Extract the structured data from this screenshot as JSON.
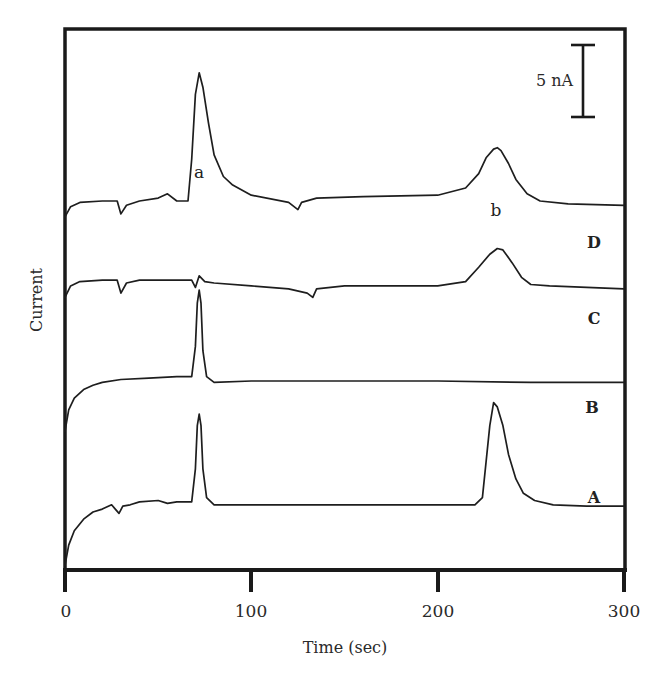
{
  "chart_data": {
    "type": "line",
    "title": "",
    "xlabel": "Time (sec)",
    "ylabel": "Current",
    "xlim": [
      0,
      300
    ],
    "xticks": [
      0,
      100,
      200,
      300
    ],
    "xtick_labels": [
      "0",
      "100",
      "200",
      "300"
    ],
    "grid": false,
    "legend": "none (traces labeled inline at right)",
    "scale_bar": {
      "label": "5 nA",
      "value_nA": 5
    },
    "peak_labels": [
      {
        "label": "a",
        "time_sec": 72
      },
      {
        "label": "b",
        "time_sec": 232
      }
    ],
    "series_note": "Stacked amperometric traces, vertically offset; y values are relative current in nA (arbitrary offset).",
    "series": [
      {
        "name": "D",
        "offset_nA": 21,
        "x": [
          0,
          3,
          8,
          20,
          28,
          30,
          33,
          40,
          50,
          55,
          60,
          66,
          68,
          70,
          72,
          74,
          77,
          80,
          85,
          90,
          100,
          120,
          125,
          127,
          135,
          160,
          200,
          215,
          222,
          226,
          230,
          232,
          234,
          238,
          242,
          248,
          255,
          270,
          300
        ],
        "y": [
          -0.5,
          0.2,
          0.5,
          0.6,
          0.6,
          -0.3,
          0.3,
          0.6,
          0.8,
          1.1,
          0.6,
          0.6,
          3.5,
          8.0,
          9.5,
          8.5,
          6.0,
          3.8,
          2.3,
          1.7,
          1.0,
          0.5,
          0.0,
          0.5,
          0.8,
          0.9,
          1.0,
          1.5,
          2.5,
          3.6,
          4.2,
          4.3,
          4.1,
          3.2,
          2.1,
          1.1,
          0.6,
          0.4,
          0.3
        ]
      },
      {
        "name": "C",
        "offset_nA": 15.5,
        "x": [
          0,
          3,
          8,
          20,
          28,
          30,
          33,
          40,
          60,
          68,
          70,
          72,
          75,
          80,
          100,
          120,
          130,
          133,
          135,
          150,
          200,
          215,
          222,
          228,
          232,
          235,
          240,
          245,
          250,
          260,
          300
        ],
        "y": [
          -0.6,
          0.2,
          0.5,
          0.6,
          0.6,
          -0.3,
          0.4,
          0.6,
          0.6,
          0.6,
          0.1,
          0.9,
          0.5,
          0.4,
          0.2,
          0.0,
          -0.3,
          -0.6,
          0.0,
          0.2,
          0.2,
          0.5,
          1.5,
          2.4,
          2.8,
          2.7,
          1.8,
          0.8,
          0.3,
          0.2,
          0.0
        ]
      },
      {
        "name": "B",
        "offset_nA": 8,
        "x": [
          0,
          2,
          5,
          10,
          15,
          20,
          30,
          45,
          60,
          68,
          70,
          71,
          72,
          73,
          74,
          76,
          80,
          100,
          150,
          200,
          250,
          300
        ],
        "y": [
          -2.4,
          -0.9,
          -0.1,
          0.5,
          0.8,
          1.0,
          1.2,
          1.3,
          1.4,
          1.4,
          3.5,
          6.5,
          7.4,
          6.5,
          3.2,
          1.4,
          1.0,
          1.1,
          1.1,
          1.1,
          1.0,
          1.0
        ]
      },
      {
        "name": "A",
        "offset_nA": 0,
        "x": [
          0,
          2,
          5,
          10,
          15,
          20,
          25,
          27,
          29,
          31,
          35,
          40,
          50,
          55,
          60,
          68,
          70,
          71,
          72,
          73,
          74,
          76,
          80,
          100,
          150,
          200,
          220,
          224,
          226,
          228,
          230,
          232,
          235,
          238,
          242,
          246,
          252,
          262,
          280,
          300
        ],
        "y": [
          -3.7,
          -2.3,
          -1.3,
          -0.5,
          0.0,
          0.2,
          0.5,
          0.2,
          -0.1,
          0.4,
          0.5,
          0.7,
          0.8,
          0.6,
          0.7,
          0.7,
          3.0,
          6.0,
          6.8,
          6.0,
          3.0,
          1.0,
          0.5,
          0.5,
          0.5,
          0.5,
          0.5,
          1.0,
          3.5,
          6.0,
          7.6,
          7.3,
          6.0,
          4.0,
          2.3,
          1.3,
          0.8,
          0.5,
          0.4,
          0.4
        ]
      }
    ]
  },
  "labels": {
    "y_axis_title": "Current",
    "x_axis_title": "Time (sec)",
    "scale_bar": "5 nA",
    "peak_a": "a",
    "peak_b": "b",
    "trace_d": "D",
    "trace_c": "C",
    "trace_b": "B",
    "trace_a": "A",
    "xtick_0": "0",
    "xtick_100": "100",
    "xtick_200": "200",
    "xtick_300": "300"
  }
}
